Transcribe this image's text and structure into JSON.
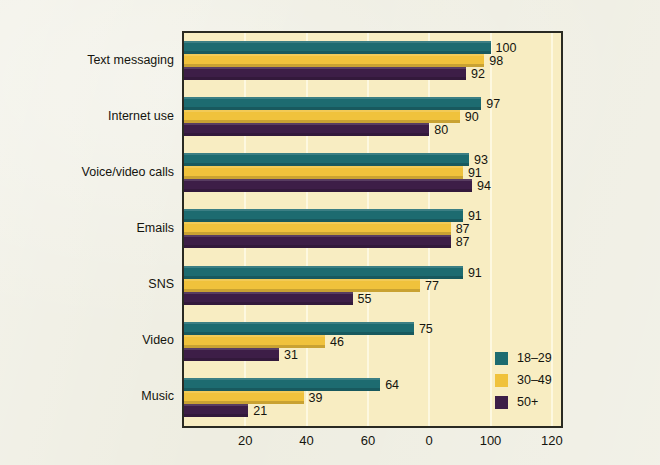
{
  "chart_data": {
    "type": "bar",
    "orientation": "horizontal",
    "title": "",
    "subtitle": "",
    "xlabel": "",
    "ylabel": "",
    "categories": [
      "Text messaging",
      "Internet use",
      "Voice/video calls",
      "Emails",
      "SNS",
      "Video",
      "Music"
    ],
    "series": [
      {
        "name": "18–29",
        "color": "#1d6b70",
        "values": [
          100,
          97,
          93,
          91,
          91,
          75,
          64
        ]
      },
      {
        "name": "30–49",
        "color": "#f0c23c",
        "values": [
          98,
          90,
          91,
          87,
          77,
          46,
          39
        ]
      },
      {
        "name": "50+",
        "color": "#3d1e47",
        "values": [
          92,
          80,
          94,
          87,
          55,
          31,
          21
        ]
      }
    ],
    "xlim": [
      0,
      123
    ],
    "xticks": [
      20,
      40,
      60,
      80,
      100,
      120
    ],
    "xtick_labels": [
      "20",
      "40",
      "60",
      "0",
      "100",
      "120"
    ],
    "grid": true,
    "grid_axis": "x",
    "legend_position": "bottom-right",
    "data_labels": true
  },
  "colors": {
    "page_background": "#eeedE1",
    "plot_background": "#f8edc2",
    "plot_border": "#2a2a22",
    "gridline": "#fdf8e0",
    "text": "#14140e",
    "series_18_29": "#1d6b70",
    "series_30_49": "#f0c23c",
    "series_50_plus": "#3d1e47"
  },
  "legend": {
    "items": [
      {
        "label": "18–29",
        "swatch": "legend-swatch-18-29"
      },
      {
        "label": "30–49",
        "swatch": "legend-swatch-30-49"
      },
      {
        "label": "50+",
        "swatch": "legend-swatch-50-plus"
      }
    ]
  }
}
